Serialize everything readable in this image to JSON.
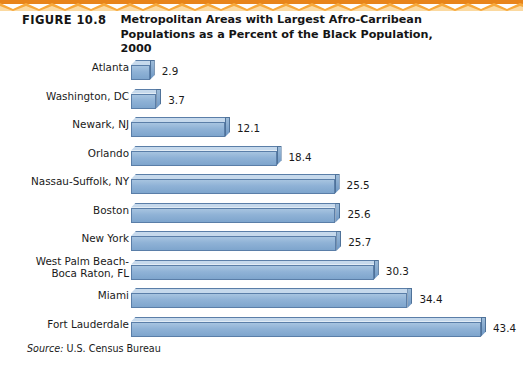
{
  "figure": {
    "number_label": "FIGURE 10.8",
    "title": "Metropolitan Areas with Largest Afro-Carribean Populations as a Percent of the Black Population, 2000",
    "source_word": "Source:",
    "source_text": " U.S. Census Bureau"
  },
  "decoration": {
    "band_name": "orange-wave-band",
    "band_color_dark": "#E8841A",
    "band_color_light": "#F7A93C",
    "band_color_pale": "#FBD9A0"
  },
  "colors": {
    "bar_front": "#8FB2D6",
    "bar_top": "#C6D9EC",
    "bar_side": "#6E97C4",
    "bar_outline": "#5A7EA8",
    "text": "#1A1A1A"
  },
  "chart_data": {
    "type": "bar",
    "orientation": "horizontal",
    "title": "Metropolitan Areas with Largest Afro-Carribean Populations as a Percent of the Black Population, 2000",
    "xlabel": "",
    "ylabel": "",
    "xlim": [
      0,
      43.4
    ],
    "grid": false,
    "legend": "none",
    "value_labels_shown": true,
    "units": "percent",
    "categories": [
      "Atlanta",
      "Washington, DC",
      "Newark, NJ",
      "Orlando",
      "Nassau-Suffolk, NY",
      "Boston",
      "New York",
      "West Palm Beach-\nBoca Raton, FL",
      "Miami",
      "Fort Lauderdale"
    ],
    "values": [
      2.9,
      3.7,
      12.1,
      18.4,
      25.5,
      25.6,
      25.7,
      30.3,
      34.4,
      43.4
    ],
    "value_labels": [
      "2.9",
      "3.7",
      "12.1",
      "18.4",
      "25.5",
      "25.6",
      "25.7",
      "30.3",
      "34.4",
      "43.4"
    ]
  }
}
